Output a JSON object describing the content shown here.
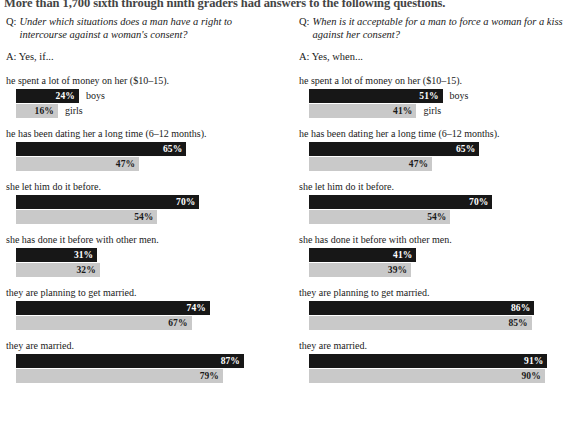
{
  "headline": "More than 1,700 sixth through ninth graders had answers to the following questions.",
  "series": {
    "boys_label": "boys",
    "girls_label": "girls",
    "boys_color": "#171717",
    "girls_color": "#c9c9c9"
  },
  "columns": [
    {
      "question_label": "Q:",
      "question_text": "Under which situations does a man have a right to intercourse against a woman's consent?",
      "answer_text": "A: Yes, if...",
      "groups": [
        {
          "label": "he spent a lot of money on her ($10–15).",
          "boys_value": "24%",
          "girls_value": "16%",
          "boys_pct": 24,
          "girls_pct": 16,
          "show_series_names": true
        },
        {
          "label": "he has been dating her a long time (6–12 months).",
          "boys_value": "65%",
          "girls_value": "47%",
          "boys_pct": 65,
          "girls_pct": 47,
          "show_series_names": false
        },
        {
          "label": "she let him do it before.",
          "boys_value": "70%",
          "girls_value": "54%",
          "boys_pct": 70,
          "girls_pct": 54,
          "show_series_names": false
        },
        {
          "label": "she has done it before with other men.",
          "boys_value": "31%",
          "girls_value": "32%",
          "boys_pct": 31,
          "girls_pct": 32,
          "show_series_names": false
        },
        {
          "label": "they are planning to get married.",
          "boys_value": "74%",
          "girls_value": "67%",
          "boys_pct": 74,
          "girls_pct": 67,
          "show_series_names": false
        },
        {
          "label": "they are married.",
          "boys_value": "87%",
          "girls_value": "79%",
          "boys_pct": 87,
          "girls_pct": 79,
          "show_series_names": false
        }
      ]
    },
    {
      "question_label": "Q:",
      "question_text": "When is it acceptable for a man to force a woman for a kiss against her consent?",
      "answer_text": "A: Yes, when...",
      "groups": [
        {
          "label": "he spent a lot of money on her ($10–15).",
          "boys_value": "51%",
          "girls_value": "41%",
          "boys_pct": 51,
          "girls_pct": 41,
          "show_series_names": true
        },
        {
          "label": "he has been dating her a long time (6–12 months).",
          "boys_value": "65%",
          "girls_value": "47%",
          "boys_pct": 65,
          "girls_pct": 47,
          "show_series_names": false
        },
        {
          "label": "she let him do it before.",
          "boys_value": "70%",
          "girls_value": "54%",
          "boys_pct": 70,
          "girls_pct": 54,
          "show_series_names": false
        },
        {
          "label": "she has done it before with other men.",
          "boys_value": "41%",
          "girls_value": "39%",
          "boys_pct": 41,
          "girls_pct": 39,
          "show_series_names": false
        },
        {
          "label": "they are planning to get married.",
          "boys_value": "86%",
          "girls_value": "85%",
          "boys_pct": 86,
          "girls_pct": 85,
          "show_series_names": false
        },
        {
          "label": "they are married.",
          "boys_value": "91%",
          "girls_value": "90%",
          "boys_pct": 91,
          "girls_pct": 90,
          "show_series_names": false
        }
      ]
    }
  ],
  "chart_data": {
    "type": "bar",
    "title": "More than 1,700 sixth through ninth graders had answers to the following questions.",
    "xlabel": "",
    "ylabel": "",
    "xlim": [
      0,
      100
    ],
    "grid": false,
    "legend_position": "inline-right-of-first-bars",
    "orientation": "horizontal",
    "panels": [
      {
        "question": "Under which situations does a man have a right to intercourse against a woman's consent?",
        "answer_prefix": "A: Yes, if...",
        "categories": [
          "he spent a lot of money on her ($10–15).",
          "he has been dating her a long time (6–12 months).",
          "she let him do it before.",
          "she has done it before with other men.",
          "they are planning to get married.",
          "they are married."
        ],
        "series": [
          {
            "name": "boys",
            "color": "#171717",
            "values": [
              24,
              65,
              70,
              31,
              74,
              87
            ]
          },
          {
            "name": "girls",
            "color": "#c9c9c9",
            "values": [
              16,
              47,
              54,
              32,
              67,
              79
            ]
          }
        ]
      },
      {
        "question": "When is it acceptable for a man to force a woman for a kiss against her consent?",
        "answer_prefix": "A: Yes, when...",
        "categories": [
          "he spent a lot of money on her ($10–15).",
          "he has been dating her a long time (6–12 months).",
          "she let him do it before.",
          "she has done it before with other men.",
          "they are planning to get married.",
          "they are married."
        ],
        "series": [
          {
            "name": "boys",
            "color": "#171717",
            "values": [
              51,
              65,
              70,
              41,
              86,
              91
            ]
          },
          {
            "name": "girls",
            "color": "#c9c9c9",
            "values": [
              41,
              47,
              54,
              39,
              85,
              90
            ]
          }
        ]
      }
    ]
  }
}
